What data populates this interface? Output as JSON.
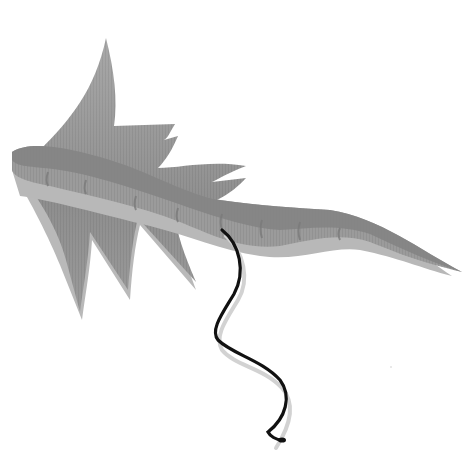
{
  "image": {
    "subject": "grey fin-winged serpentine creature with a black tether line",
    "background_color": "#ffffff",
    "colors": {
      "fin_light": "#a9a9a9",
      "fin_mid": "#9a9a9a",
      "fin_dark": "#8a8a8a",
      "body": "#999999",
      "body_dark": "#7d7d7d",
      "body_shadow": "#b5b5b5",
      "line": "#111111",
      "line_shadow": "#d4d4d4"
    }
  }
}
